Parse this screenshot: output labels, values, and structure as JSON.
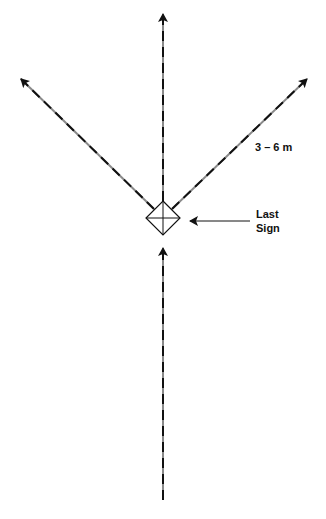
{
  "diagram": {
    "distance_label": "3 – 6 m",
    "sign_label_line1": "Last",
    "sign_label_line2": "Sign",
    "colors": {
      "line": "#111111",
      "dash_alt": "#8a8a8a",
      "background": "#ffffff"
    },
    "elements": [
      {
        "type": "dashed-arrow",
        "name": "approach-path",
        "from": [
          163,
          500
        ],
        "to": [
          163,
          245
        ]
      },
      {
        "type": "diamond-marker",
        "name": "last-sign-marker",
        "center": [
          163,
          217
        ],
        "size": 20
      },
      {
        "type": "dashed-arrow",
        "name": "straight-ahead-path",
        "from": [
          163,
          200
        ],
        "to": [
          163,
          12
        ]
      },
      {
        "type": "dashed-arrow",
        "name": "left-path",
        "from": [
          150,
          206
        ],
        "to": [
          19,
          77
        ]
      },
      {
        "type": "dashed-arrow",
        "name": "right-path",
        "from": [
          176,
          206
        ],
        "to": [
          309,
          77
        ]
      },
      {
        "type": "arrow",
        "name": "sign-pointer",
        "from": [
          250,
          222
        ],
        "to": [
          186,
          222
        ]
      }
    ]
  }
}
